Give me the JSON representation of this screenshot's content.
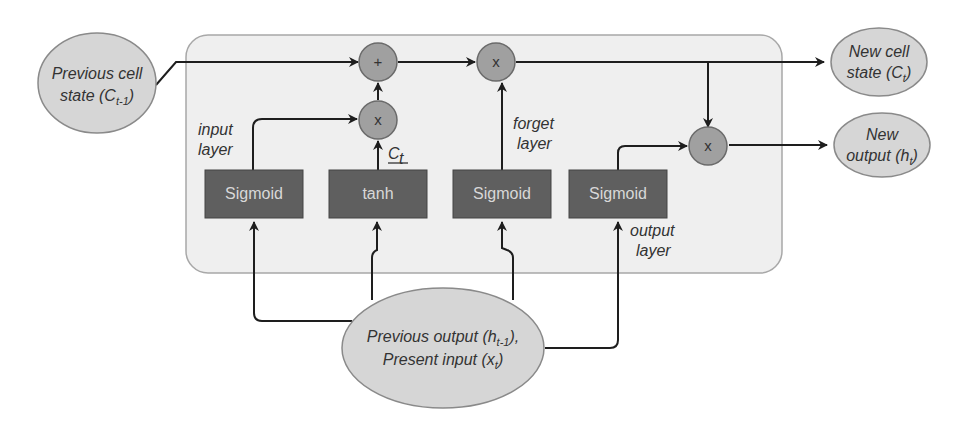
{
  "diagram": {
    "colors": {
      "cell_background": "#efefef",
      "cell_border": "#a8a8a8",
      "gate_box": "#5f5f5f",
      "gate_text": "#d8d8d8",
      "operator_circle": "#a0a0a0",
      "ellipse_fill": "#d6d6d6",
      "ellipse_border": "#8a8a8a",
      "arrow": "#1e1e1e"
    },
    "inputs": {
      "prev_cell_state": {
        "line1": "Previous cell",
        "line2_prefix": "state (",
        "symbol": "C",
        "subscript": "t-1",
        "line2_suffix": ")"
      },
      "prev_output_present_input": {
        "line1_prefix": "Previous output (",
        "line1_symbol": "h",
        "line1_subscript": "t-1",
        "line1_suffix": "),",
        "line2_prefix": "Present input (",
        "line2_symbol": "x",
        "line2_subscript": "t",
        "line2_suffix": ")"
      }
    },
    "outputs": {
      "new_cell_state": {
        "line1": "New cell",
        "line2_prefix": "state (",
        "symbol": "C",
        "subscript": "t",
        "line2_suffix": ")"
      },
      "new_output": {
        "line1": "New",
        "line2_prefix": "output (",
        "symbol": "h",
        "subscript": "t",
        "line2_suffix": ")"
      }
    },
    "gates": [
      {
        "id": "input",
        "function": "Sigmoid",
        "label_line1": "input",
        "label_line2": "layer"
      },
      {
        "id": "candidate",
        "function": "tanh",
        "label_symbol": "C",
        "label_subscript": "t"
      },
      {
        "id": "forget",
        "function": "Sigmoid",
        "label_line1": "forget",
        "label_line2": "layer"
      },
      {
        "id": "output",
        "function": "Sigmoid",
        "label_line1": "output",
        "label_line2": "layer"
      }
    ],
    "operators": {
      "add": "+",
      "mul_input": "x",
      "mul_forget": "x",
      "mul_output": "x"
    }
  }
}
